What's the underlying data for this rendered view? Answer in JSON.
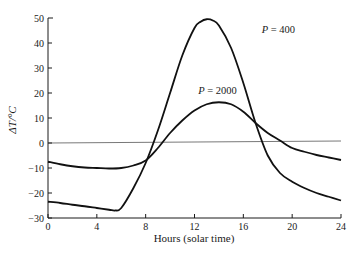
{
  "chart_data": {
    "type": "line",
    "title": "",
    "xlabel": "Hours (solar time)",
    "ylabel": "ΔT/°C",
    "xlim": [
      0,
      24
    ],
    "ylim": [
      -30,
      50
    ],
    "xticks": [
      0,
      4,
      8,
      12,
      16,
      20,
      24
    ],
    "yticks": [
      -30,
      -20,
      -10,
      0,
      10,
      20,
      30,
      40,
      50
    ],
    "grid": false,
    "reference_line": {
      "y": 0,
      "label": ""
    },
    "legend": "inline",
    "series": [
      {
        "name": "P = 400",
        "label_position": [
          17.5,
          44
        ],
        "x": [
          0,
          1,
          2,
          3,
          4,
          5,
          5.5,
          6,
          7,
          8,
          9,
          10,
          11,
          12,
          12.5,
          13,
          13.5,
          14,
          15,
          16,
          17,
          18,
          19,
          20,
          21,
          22,
          23,
          24
        ],
        "y": [
          -23.5,
          -24,
          -24.7,
          -25.3,
          -26,
          -26.7,
          -27,
          -26,
          -18,
          -8,
          5,
          20,
          35,
          46,
          48.5,
          49.5,
          49,
          47,
          38,
          24,
          8,
          -5,
          -12,
          -15.5,
          -18,
          -20,
          -21.5,
          -23
        ]
      },
      {
        "name": "P = 2000",
        "label_position": [
          12.3,
          19.5
        ],
        "x": [
          0,
          1,
          2,
          3,
          4,
          5,
          6,
          7,
          8,
          9,
          10,
          11,
          12,
          13,
          14,
          15,
          16,
          17,
          18,
          19,
          20,
          21,
          22,
          23,
          24
        ],
        "y": [
          -7.5,
          -8.5,
          -9.3,
          -9.8,
          -10,
          -10.2,
          -10,
          -9,
          -7,
          -2,
          4,
          9,
          13,
          15.5,
          16.3,
          15.5,
          12.5,
          8,
          4,
          1,
          -2,
          -3.5,
          -4.8,
          -5.8,
          -6.8
        ]
      }
    ]
  }
}
